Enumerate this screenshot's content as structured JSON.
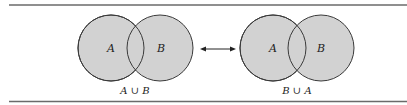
{
  "diagram": {
    "left": {
      "set_labels": [
        "A",
        "B"
      ],
      "caption": "A ∪ B"
    },
    "right": {
      "set_labels": [
        "A",
        "B"
      ],
      "caption": "B ∪ A"
    },
    "connector": "double-headed-arrow",
    "colors": {
      "fill": "#d2d2d2",
      "stroke": "#3a3a3a",
      "rule": "#6a6a6a"
    }
  }
}
